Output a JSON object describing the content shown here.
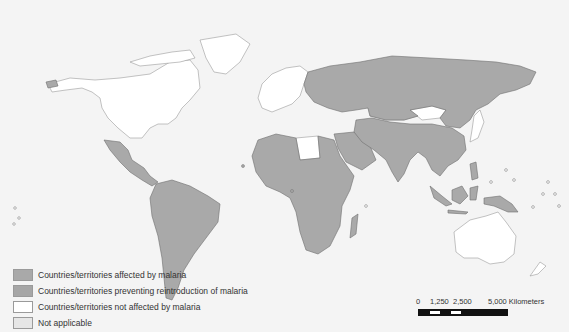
{
  "map": {
    "title": "",
    "colors": {
      "background": "#f4f4f4",
      "affected": "#a9a9a9",
      "preventing_reintroduction": "#a6a6a6",
      "not_affected": "#ffffff",
      "not_applicable": "#e6e6e6",
      "border": "#6f6f6f",
      "unaffected_border": "#9a9a9a"
    }
  },
  "legend": {
    "items": [
      {
        "label": "Countries/territories affected by malaria",
        "color": "#a9a9a9"
      },
      {
        "label": "Countries/territories preventing reintroduction of malaria",
        "color": "#a6a6a6"
      },
      {
        "label": "Countries/territories not affected by malaria",
        "color": "#ffffff"
      },
      {
        "label": "Not applicable",
        "color": "#e6e6e6"
      }
    ]
  },
  "scale_bar": {
    "labels": [
      "0",
      "1,250",
      "2,500",
      "5,000 Kilometers"
    ]
  }
}
